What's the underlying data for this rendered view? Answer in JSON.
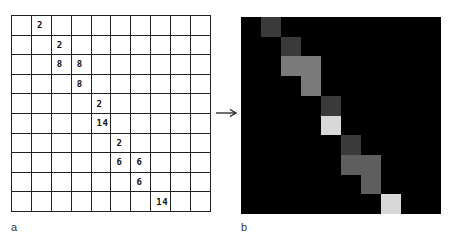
{
  "panel_a": {
    "label": "a",
    "rows": 10,
    "cols": 10,
    "cells": [
      {
        "row": 0,
        "col": 1,
        "value": "2"
      },
      {
        "row": 1,
        "col": 2,
        "value": "2"
      },
      {
        "row": 2,
        "col": 2,
        "value": "8"
      },
      {
        "row": 2,
        "col": 3,
        "value": "8"
      },
      {
        "row": 3,
        "col": 3,
        "value": "8"
      },
      {
        "row": 4,
        "col": 4,
        "value": "2"
      },
      {
        "row": 5,
        "col": 4,
        "value": "14"
      },
      {
        "row": 6,
        "col": 5,
        "value": "2"
      },
      {
        "row": 7,
        "col": 5,
        "value": "6"
      },
      {
        "row": 7,
        "col": 6,
        "value": "6"
      },
      {
        "row": 8,
        "col": 6,
        "value": "6"
      },
      {
        "row": 9,
        "col": 7,
        "value": "14"
      }
    ]
  },
  "arrow": {
    "icon": "right-arrow-icon"
  },
  "panel_b": {
    "label": "b",
    "background": "#000000",
    "value_colors": {
      "2": "#3a3a3a",
      "6": "#5e5e5e",
      "8": "#7a7a7a",
      "14": "#d8d8d8"
    }
  }
}
